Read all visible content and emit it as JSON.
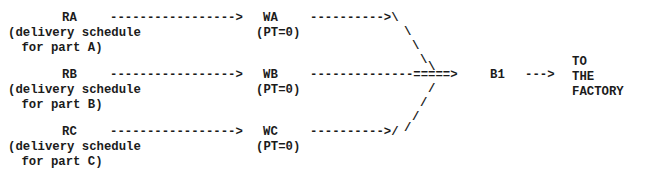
{
  "diagram": {
    "title_text": "Three-part delivery schedule converging to final assembly",
    "background_color": "#ffffff",
    "text_color": "#1b1b1b",
    "rows": [
      {
        "source_label": "RA",
        "source_desc_line1": "(delivery schedule",
        "source_desc_line2": " for part A)",
        "arrow_to_w": "----------------->",
        "w_node": "WA",
        "w_param": "(PT=0)",
        "arrow_from_w": "---------->\\"
      },
      {
        "source_label": "RB",
        "source_desc_line1": "(delivery schedule",
        "source_desc_line2": " for part B)",
        "arrow_to_w": "----------------->",
        "w_node": "WB",
        "w_param": "(PT=0)",
        "arrow_from_w": "--------------=====>"
      },
      {
        "source_label": "RC",
        "source_desc_line1": "(delivery schedule",
        "source_desc_line2": " for part C)",
        "arrow_to_w": "----------------->",
        "w_node": "WC",
        "w_param": "(PT=0)",
        "arrow_from_w": "---------->/"
      }
    ],
    "merge": {
      "upper_diagonal_1": "\\",
      "upper_diagonal_2": "\\",
      "upper_diagonal_3": "\\",
      "upper_diagonal_4": "\\",
      "lower_diagonal_1": "/",
      "lower_diagonal_2": "/",
      "lower_diagonal_3": "/",
      "lower_diagonal_4": "/"
    },
    "buffer_node": "B1",
    "arrow_to_factory": "--->",
    "destination_line1": "TO",
    "destination_line2": "THE",
    "destination_line3": "FACTORY"
  }
}
